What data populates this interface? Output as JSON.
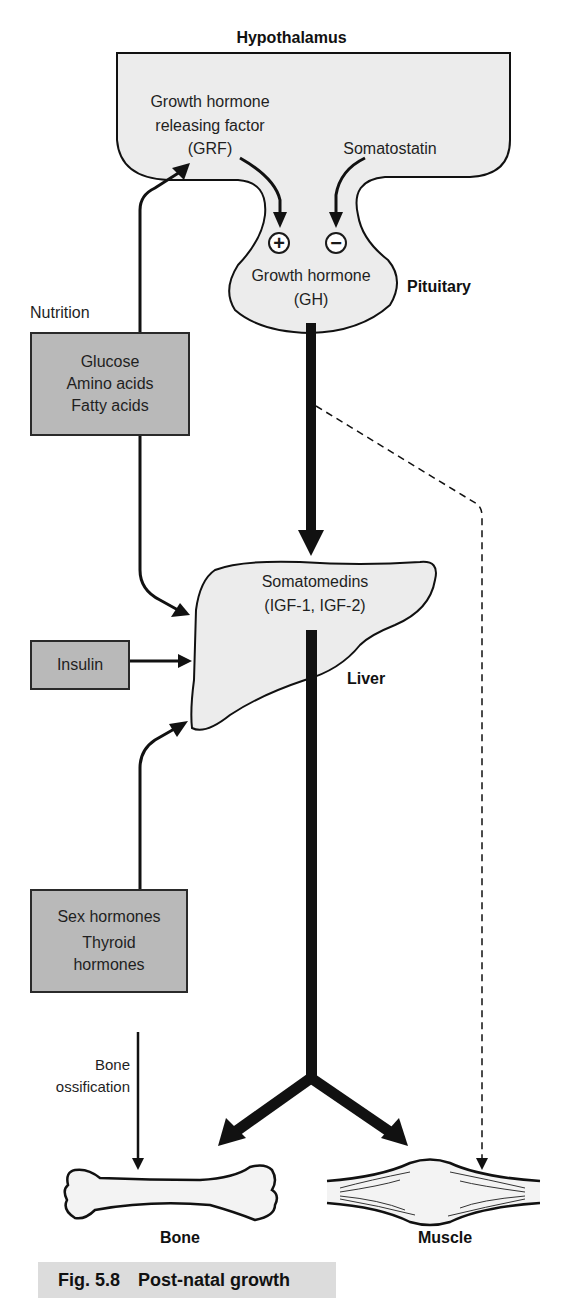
{
  "diagram": {
    "caption": {
      "figure_number": "Fig. 5.8",
      "title": "Post-natal growth"
    },
    "regions": {
      "hypothalamus": "Hypothalamus",
      "pituitary": "Pituitary",
      "liver": "Liver",
      "bone": "Bone",
      "muscle": "Muscle"
    },
    "hypothalamus_contents": {
      "grf_line1": "Growth hormone",
      "grf_line2": "releasing factor",
      "grf_line3": "(GRF)",
      "somatostatin": "Somatostatin"
    },
    "pituitary_contents": {
      "plus_sign": "+",
      "minus_sign": "−",
      "gh_line1": "Growth hormone",
      "gh_line2": "(GH)"
    },
    "liver_contents": {
      "line1": "Somatomedins",
      "line2": "(IGF-1, IGF-2)"
    },
    "nutrition": {
      "label": "Nutrition",
      "items": [
        "Glucose",
        "Amino acids",
        "Fatty acids"
      ]
    },
    "insulin_box": {
      "label": "Insulin"
    },
    "hormones_box": {
      "line1": "Sex hormones",
      "line2": "Thyroid",
      "line3": "hormones"
    },
    "bone_ossification": {
      "line1": "Bone",
      "line2": "ossification"
    },
    "colors": {
      "organ_fill": "#ececec",
      "box_fill": "#b9b9b9",
      "stroke": "#111111",
      "caption_bg": "#dcdcdc"
    }
  }
}
